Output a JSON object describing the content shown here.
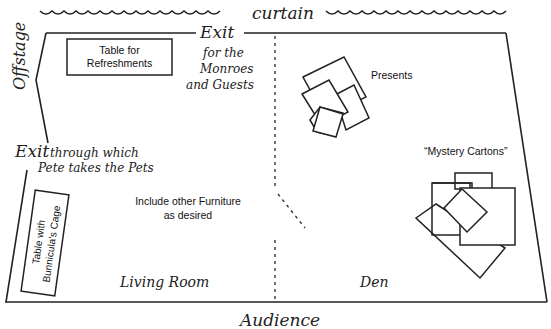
{
  "diagram": {
    "type": "stage-floor-plan",
    "labels": {
      "curtain": "curtain",
      "offstage": "Offstage",
      "audience": "Audience",
      "exit_top": "Exit",
      "exit_top_note": [
        "for the",
        "Monroes",
        "and Guests"
      ],
      "exit_left": "Exit",
      "exit_left_note": [
        "through which",
        "Pete takes the Pets"
      ],
      "living_room": "Living Room",
      "den": "Den",
      "presents": "Presents",
      "mystery_cartons": "“Mystery Cartons”",
      "furniture_note": [
        "Include other Furniture",
        "as desired"
      ],
      "refreshments_table": [
        "Table for",
        "Refreshments"
      ],
      "cage_table": [
        "Table with",
        "Bunnicula's Cage"
      ]
    },
    "colors": {
      "line": "#222222",
      "background": "#ffffff"
    }
  }
}
